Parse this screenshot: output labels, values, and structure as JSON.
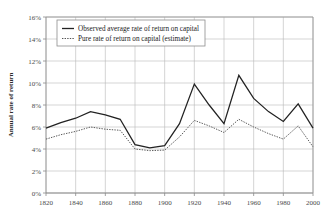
{
  "chart_data": {
    "type": "line",
    "title": "",
    "xlabel": "",
    "ylabel": "Annual rate of return",
    "xlim": [
      1820,
      2000
    ],
    "ylim": [
      0,
      16
    ],
    "grid": true,
    "legend_position": "top-left",
    "x_tick_labels": [
      "1820",
      "1840",
      "1860",
      "1880",
      "1900",
      "1920",
      "1940",
      "1960",
      "1980",
      "2000"
    ],
    "x_ticks": [
      1820,
      1840,
      1860,
      1880,
      1900,
      1920,
      1940,
      1960,
      1980,
      2000
    ],
    "y_tick_labels": [
      "0%",
      "2%",
      "4%",
      "6%",
      "8%",
      "10%",
      "12%",
      "14%",
      "16%"
    ],
    "y_ticks": [
      0,
      2,
      4,
      6,
      8,
      10,
      12,
      14,
      16
    ],
    "x": [
      1820,
      1830,
      1840,
      1850,
      1860,
      1870,
      1880,
      1890,
      1900,
      1910,
      1920,
      1930,
      1940,
      1950,
      1960,
      1970,
      1980,
      1990,
      2000
    ],
    "series": [
      {
        "name": "Observed average rate of return on capital",
        "style": "solid",
        "color": "#222222",
        "values": [
          5.9,
          6.4,
          6.8,
          7.4,
          7.1,
          6.7,
          4.4,
          4.1,
          4.3,
          6.3,
          9.9,
          8.0,
          6.3,
          10.7,
          8.6,
          7.4,
          6.5,
          8.1,
          5.9
        ]
      },
      {
        "name": "Pure rate of return on capital (estimate)",
        "style": "dotted",
        "color": "#5a5a5a",
        "values": [
          4.9,
          5.3,
          5.6,
          6.0,
          5.8,
          5.7,
          4.0,
          3.85,
          3.9,
          5.1,
          6.6,
          6.1,
          5.5,
          6.7,
          6.0,
          5.4,
          4.9,
          6.1,
          4.2
        ]
      }
    ],
    "legend_entries": [
      "Observed average rate of return on capital",
      "Pure rate of return on capital (estimate)"
    ]
  },
  "plot": {
    "left": 46,
    "right": 313,
    "top": 17,
    "bottom": 193
  },
  "legend": {
    "x": 57,
    "y": 20,
    "width": 148,
    "height": 26
  }
}
